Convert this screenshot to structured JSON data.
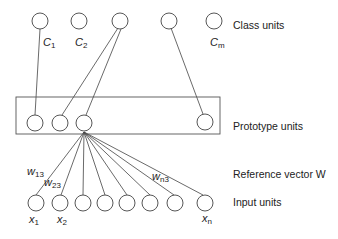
{
  "diagram": {
    "type": "neural-network (LVQ architecture)",
    "layers": {
      "class": {
        "label": "Class units",
        "node_count_shown": 5,
        "node_labels": [
          "C1",
          "C2",
          "",
          "",
          "Cm"
        ]
      },
      "prototype": {
        "label": "Prototype units",
        "node_count_shown": 4
      },
      "reference": {
        "label": "Reference vector W"
      },
      "input": {
        "label": "Input units",
        "node_count_shown": 8,
        "node_labels": [
          "x1",
          "x2",
          "",
          "",
          "",
          "",
          "",
          "xn"
        ]
      }
    },
    "labels": {
      "class_units": "Class units",
      "prototype_units": "Prototype units",
      "reference_vector": "Reference vector W",
      "input_units": "Input units",
      "c1": "C",
      "c1_sub": "1",
      "c2": "C",
      "c2_sub": "2",
      "cm": "C",
      "cm_sub": "m",
      "x1": "x",
      "x1_sub": "1",
      "x2": "x",
      "x2_sub": "2",
      "xn": "x",
      "xn_sub": "n",
      "w13": "w",
      "w13_sub": "13",
      "w23": "w",
      "w23_sub": "23",
      "wn3": "w",
      "wn3_sub": "n3"
    },
    "edges": [
      {
        "from": "class-1",
        "to": "prototype-1"
      },
      {
        "from": "class-3",
        "to": "prototype-2"
      },
      {
        "from": "class-3",
        "to": "prototype-3"
      },
      {
        "from": "class-4",
        "to": "prototype-4"
      },
      {
        "from": "prototype-3",
        "to": "input-1..n",
        "weights_labeled": [
          "w13",
          "w23",
          "wn3"
        ]
      }
    ]
  }
}
